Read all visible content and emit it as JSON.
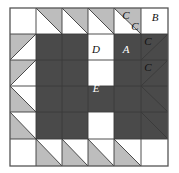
{
  "block": {
    "title": "Quilt block diagram",
    "geometry": {
      "left": 10,
      "top": 8,
      "size": 158,
      "cols": 6,
      "rows": 6,
      "col_edges": [
        10,
        36,
        62,
        88,
        114,
        141,
        168
      ],
      "row_edges": [
        8,
        34,
        60,
        86,
        112,
        139,
        166
      ]
    },
    "colors": {
      "dark": "#4a4a4a",
      "light_gray": "#bdbdbd",
      "white": "#ffffff",
      "line": "#3a3a3a",
      "border": "#555555",
      "text": "#111111",
      "text_on_dark": "#ffffff"
    },
    "labels": [
      {
        "name": "label-A",
        "text": "A",
        "x": 126,
        "y": 53,
        "on_dark": true
      },
      {
        "name": "label-B",
        "text": "B",
        "x": 155,
        "y": 21,
        "on_dark": false
      },
      {
        "name": "label-C-1",
        "text": "C",
        "x": 126,
        "y": 19,
        "on_dark": false
      },
      {
        "name": "label-C-2",
        "text": "C",
        "x": 135,
        "y": 30,
        "on_dark": false
      },
      {
        "name": "label-C-3",
        "text": "C",
        "x": 148,
        "y": 45,
        "on_dark": false
      },
      {
        "name": "label-C-4",
        "text": "C",
        "x": 148,
        "y": 71,
        "on_dark": false
      },
      {
        "name": "label-D",
        "text": "D",
        "x": 96,
        "y": 53,
        "on_dark": false
      },
      {
        "name": "label-E",
        "text": "E",
        "x": 96,
        "y": 92,
        "on_dark": true
      }
    ],
    "pieces": {
      "dark_squares": [
        {
          "name": "dark-square-top-left",
          "x": 36,
          "y": 34,
          "w": 52,
          "h": 52
        },
        {
          "name": "dark-square-top-right",
          "x": 114,
          "y": 34,
          "w": 54,
          "h": 52
        },
        {
          "name": "dark-square-bottom-left",
          "x": 36,
          "y": 86,
          "w": 52,
          "h": 53
        },
        {
          "name": "dark-square-bottom-right",
          "x": 114,
          "y": 86,
          "w": 54,
          "h": 53
        },
        {
          "name": "center-square-E",
          "x": 88,
          "y": 86,
          "w": 26,
          "h": 26
        }
      ],
      "gray_triangles": [
        {
          "name": "tri-top-c2",
          "pts": "36,8 62,8 62,34",
          "orient": "bl"
        },
        {
          "name": "tri-top-c3",
          "pts": "62,8 88,8 88,34",
          "orient": "bl"
        },
        {
          "name": "tri-top-c5",
          "pts": "88,8 114,8 114,34",
          "orient": "bl"
        },
        {
          "name": "tri-top-c6",
          "pts": "114,8 141,8 141,34",
          "orient": "bl"
        },
        {
          "name": "tri-left-r2",
          "pts": "10,34 36,34 10,60",
          "orient": "tl"
        },
        {
          "name": "tri-left-r3",
          "pts": "10,60 36,60 10,86",
          "orient": "tl"
        },
        {
          "name": "tri-right-r2",
          "pts": "141,34 168,34 141,60",
          "orient": "tl"
        },
        {
          "name": "tri-right-r3",
          "pts": "141,60 168,60 141,86",
          "orient": "tl"
        },
        {
          "name": "tri-left-r5",
          "pts": "10,86 36,112 10,112",
          "orient": "bl"
        },
        {
          "name": "tri-left-r6",
          "pts": "10,112 36,139 10,139",
          "orient": "bl"
        },
        {
          "name": "tri-right-r5",
          "pts": "141,86 168,86 168,112",
          "orient": "tr"
        },
        {
          "name": "tri-right-r6",
          "pts": "141,112 168,112 168,139",
          "orient": "tr"
        },
        {
          "name": "tri-bot-c2",
          "pts": "36,166 36,139 62,166",
          "orient": "br"
        },
        {
          "name": "tri-bot-c3",
          "pts": "62,166 62,139 88,166",
          "orient": "br"
        },
        {
          "name": "tri-bot-c5",
          "pts": "88,166 88,139 114,166",
          "orient": "br"
        },
        {
          "name": "tri-bot-c6",
          "pts": "114,166 114,139 141,166",
          "orient": "br"
        }
      ],
      "grid_lines": [
        {
          "name": "grid-line-v-1",
          "x1": 36,
          "y1": 8,
          "x2": 36,
          "y2": 166
        },
        {
          "name": "grid-line-v-2",
          "x1": 62,
          "y1": 8,
          "x2": 62,
          "y2": 166
        },
        {
          "name": "grid-line-v-3",
          "x1": 88,
          "y1": 8,
          "x2": 88,
          "y2": 166
        },
        {
          "name": "grid-line-v-4",
          "x1": 114,
          "y1": 8,
          "x2": 114,
          "y2": 166
        },
        {
          "name": "grid-line-v-5",
          "x1": 141,
          "y1": 8,
          "x2": 141,
          "y2": 166
        },
        {
          "name": "grid-line-h-1",
          "x1": 10,
          "y1": 34,
          "x2": 168,
          "y2": 34
        },
        {
          "name": "grid-line-h-2",
          "x1": 10,
          "y1": 60,
          "x2": 168,
          "y2": 60
        },
        {
          "name": "grid-line-h-3",
          "x1": 10,
          "y1": 86,
          "x2": 168,
          "y2": 86
        },
        {
          "name": "grid-line-h-4",
          "x1": 10,
          "y1": 112,
          "x2": 168,
          "y2": 112
        },
        {
          "name": "grid-line-h-5",
          "x1": 10,
          "y1": 139,
          "x2": 168,
          "y2": 139
        }
      ],
      "diagonals": [
        {
          "name": "diag-top-c2",
          "x1": 36,
          "y1": 8,
          "x2": 62,
          "y2": 34
        },
        {
          "name": "diag-top-c3",
          "x1": 62,
          "y1": 8,
          "x2": 88,
          "y2": 34
        },
        {
          "name": "diag-top-c5",
          "x1": 88,
          "y1": 8,
          "x2": 114,
          "y2": 34
        },
        {
          "name": "diag-top-c6",
          "x1": 114,
          "y1": 8,
          "x2": 141,
          "y2": 34
        },
        {
          "name": "diag-left-r2",
          "x1": 36,
          "y1": 34,
          "x2": 10,
          "y2": 60
        },
        {
          "name": "diag-left-r3",
          "x1": 36,
          "y1": 60,
          "x2": 10,
          "y2": 86
        },
        {
          "name": "diag-right-r2",
          "x1": 168,
          "y1": 34,
          "x2": 141,
          "y2": 60
        },
        {
          "name": "diag-right-r3",
          "x1": 168,
          "y1": 60,
          "x2": 141,
          "y2": 86
        },
        {
          "name": "diag-left-r5",
          "x1": 10,
          "y1": 86,
          "x2": 36,
          "y2": 112
        },
        {
          "name": "diag-left-r6",
          "x1": 10,
          "y1": 112,
          "x2": 36,
          "y2": 139
        },
        {
          "name": "diag-right-r5",
          "x1": 141,
          "y1": 86,
          "x2": 168,
          "y2": 112
        },
        {
          "name": "diag-right-r6",
          "x1": 141,
          "y1": 112,
          "x2": 168,
          "y2": 139
        },
        {
          "name": "diag-bot-c2",
          "x1": 36,
          "y1": 139,
          "x2": 62,
          "y2": 166
        },
        {
          "name": "diag-bot-c3",
          "x1": 62,
          "y1": 139,
          "x2": 88,
          "y2": 166
        },
        {
          "name": "diag-bot-c5",
          "x1": 88,
          "y1": 139,
          "x2": 114,
          "y2": 166
        },
        {
          "name": "diag-bot-c6",
          "x1": 114,
          "y1": 139,
          "x2": 141,
          "y2": 166
        }
      ]
    }
  }
}
